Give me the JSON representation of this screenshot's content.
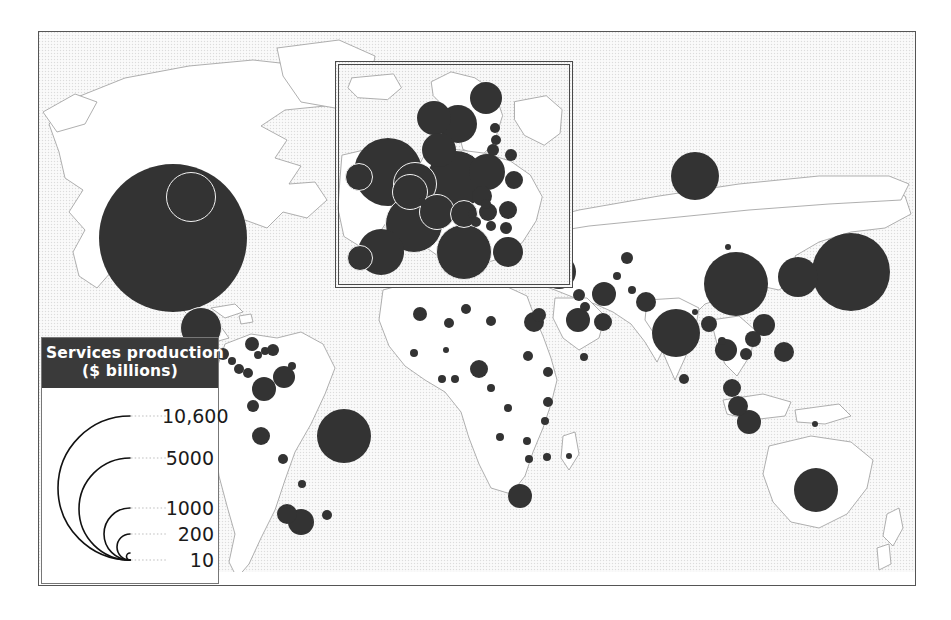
{
  "figure": {
    "type": "proportional-symbol-map",
    "theme": "Services production by country",
    "units": "$ billions"
  },
  "legend": {
    "title_line1": "Services production",
    "title_line2": "($ billions)",
    "scale_type": "nested semicircle area scale",
    "breaks": [
      {
        "label": "10,600",
        "value": 10600
      },
      {
        "label": "5000",
        "value": 5000
      },
      {
        "label": "1000",
        "value": 1000
      },
      {
        "label": "200",
        "value": 200
      },
      {
        "label": "10",
        "value": 10
      }
    ]
  },
  "inset": {
    "region": "Europe",
    "label": ""
  },
  "colors": {
    "symbol_fill": "#333333",
    "symbol_halo": "#f2f2f2",
    "land_fill": "#ffffff",
    "land_stroke": "#9a9a9a",
    "ocean_tint": "#fdfdfd",
    "frame_stroke": "#555555",
    "legend_header_bg": "#3a3a3a",
    "legend_header_text": "#ffffff"
  },
  "chart_data": {
    "type": "scatter",
    "title": "Services production ($ billions)",
    "xlabel": "longitude",
    "ylabel": "latitude",
    "value_key": "services_production_usd_billions",
    "size_encoding": "circle area proportional to value",
    "legend_breaks": [
      10600,
      5000,
      1000,
      200,
      10
    ],
    "points": [
      {
        "name": "United States",
        "value": 10600,
        "cx": 134,
        "cy": 206,
        "r": 74
      },
      {
        "name": "Canada",
        "value": 700,
        "cx": 152,
        "cy": 165,
        "r": 25,
        "ring": true
      },
      {
        "name": "Mexico",
        "value": 480,
        "cx": 162,
        "cy": 296,
        "r": 21,
        "ring": true
      },
      {
        "name": "Guatemala",
        "value": 18,
        "cx": 184,
        "cy": 322,
        "r": 6
      },
      {
        "name": "Honduras",
        "value": 9,
        "cx": 193,
        "cy": 329,
        "r": 4
      },
      {
        "name": "Cuba",
        "value": 30,
        "cx": 213,
        "cy": 312,
        "r": 7
      },
      {
        "name": "Haiti",
        "value": 7,
        "cx": 226,
        "cy": 319,
        "r": 4
      },
      {
        "name": "Dominican Republic",
        "value": 22,
        "cx": 234,
        "cy": 318,
        "r": 6
      },
      {
        "name": "Jamaica",
        "value": 8,
        "cx": 219,
        "cy": 323,
        "r": 4
      },
      {
        "name": "Costa Rica",
        "value": 17,
        "cx": 200,
        "cy": 337,
        "r": 5
      },
      {
        "name": "Panama",
        "value": 14,
        "cx": 209,
        "cy": 341,
        "r": 5
      },
      {
        "name": "Trinidad",
        "value": 9,
        "cx": 253,
        "cy": 334,
        "r": 4
      },
      {
        "name": "Venezuela",
        "value": 70,
        "cx": 245,
        "cy": 345,
        "r": 11
      },
      {
        "name": "Colombia",
        "value": 60,
        "cx": 225,
        "cy": 357,
        "r": 12
      },
      {
        "name": "Ecuador",
        "value": 20,
        "cx": 214,
        "cy": 374,
        "r": 6
      },
      {
        "name": "Peru",
        "value": 40,
        "cx": 222,
        "cy": 404,
        "r": 9
      },
      {
        "name": "Brazil",
        "value": 480,
        "cx": 305,
        "cy": 404,
        "r": 27
      },
      {
        "name": "Bolivia",
        "value": 10,
        "cx": 244,
        "cy": 427,
        "r": 5
      },
      {
        "name": "Paraguay",
        "value": 8,
        "cx": 263,
        "cy": 452,
        "r": 4
      },
      {
        "name": "Chile",
        "value": 55,
        "cx": 248,
        "cy": 482,
        "r": 10
      },
      {
        "name": "Argentina",
        "value": 140,
        "cx": 262,
        "cy": 490,
        "r": 13
      },
      {
        "name": "Uruguay",
        "value": 12,
        "cx": 288,
        "cy": 483,
        "r": 5
      },
      {
        "name": "Morocco",
        "value": 30,
        "cx": 381,
        "cy": 282,
        "r": 7
      },
      {
        "name": "Algeria",
        "value": 30,
        "cx": 410,
        "cy": 291,
        "r": 5
      },
      {
        "name": "Tunisia",
        "value": 16,
        "cx": 427,
        "cy": 277,
        "r": 5
      },
      {
        "name": "Libya",
        "value": 12,
        "cx": 452,
        "cy": 289,
        "r": 5
      },
      {
        "name": "Egypt",
        "value": 60,
        "cx": 495,
        "cy": 290,
        "r": 10
      },
      {
        "name": "Senegal",
        "value": 7,
        "cx": 375,
        "cy": 321,
        "r": 4
      },
      {
        "name": "Mali",
        "value": 5,
        "cx": 407,
        "cy": 318,
        "r": 3
      },
      {
        "name": "Ghana",
        "value": 8,
        "cx": 416,
        "cy": 347,
        "r": 4
      },
      {
        "name": "Nigeria",
        "value": 38,
        "cx": 440,
        "cy": 337,
        "r": 9
      },
      {
        "name": "Cote d'Ivoire",
        "value": 9,
        "cx": 403,
        "cy": 347,
        "r": 4
      },
      {
        "name": "Cameroon",
        "value": 9,
        "cx": 452,
        "cy": 356,
        "r": 4
      },
      {
        "name": "Sudan",
        "value": 14,
        "cx": 489,
        "cy": 324,
        "r": 5
      },
      {
        "name": "Ethiopia",
        "value": 10,
        "cx": 509,
        "cy": 340,
        "r": 5
      },
      {
        "name": "Kenya",
        "value": 14,
        "cx": 509,
        "cy": 370,
        "r": 5
      },
      {
        "name": "Tanzania",
        "value": 10,
        "cx": 506,
        "cy": 389,
        "r": 4
      },
      {
        "name": "DR Congo",
        "value": 7,
        "cx": 469,
        "cy": 376,
        "r": 4
      },
      {
        "name": "Angola",
        "value": 11,
        "cx": 461,
        "cy": 405,
        "r": 4
      },
      {
        "name": "Zambia",
        "value": 6,
        "cx": 488,
        "cy": 409,
        "r": 4
      },
      {
        "name": "Zimbabwe",
        "value": 7,
        "cx": 490,
        "cy": 427,
        "r": 4
      },
      {
        "name": "Mozambique",
        "value": 6,
        "cx": 508,
        "cy": 425,
        "r": 4
      },
      {
        "name": "Madagascar",
        "value": 5,
        "cx": 530,
        "cy": 424,
        "r": 3
      },
      {
        "name": "South Africa",
        "value": 110,
        "cx": 481,
        "cy": 464,
        "r": 12
      },
      {
        "name": "Israel",
        "value": 85,
        "cx": 500,
        "cy": 283,
        "r": 7
      },
      {
        "name": "Turkey",
        "value": 170,
        "cx": 520,
        "cy": 240,
        "r": 17
      },
      {
        "name": "Greece",
        "value": 120,
        "cx": 498,
        "cy": 247,
        "r": 6
      },
      {
        "name": "Saudi Arabia",
        "value": 110,
        "cx": 539,
        "cy": 288,
        "r": 12
      },
      {
        "name": "United Arab Emirates",
        "value": 50,
        "cx": 564,
        "cy": 290,
        "r": 9
      },
      {
        "name": "Iran",
        "value": 90,
        "cx": 565,
        "cy": 262,
        "r": 12
      },
      {
        "name": "Iraq",
        "value": 20,
        "cx": 540,
        "cy": 263,
        "r": 6
      },
      {
        "name": "Kuwait",
        "value": 18,
        "cx": 546,
        "cy": 275,
        "r": 5
      },
      {
        "name": "Yemen",
        "value": 7,
        "cx": 545,
        "cy": 325,
        "r": 4
      },
      {
        "name": "Kazakhstan",
        "value": 30,
        "cx": 588,
        "cy": 226,
        "r": 6
      },
      {
        "name": "Uzbekistan",
        "value": 10,
        "cx": 578,
        "cy": 244,
        "r": 4
      },
      {
        "name": "Russia",
        "value": 420,
        "cx": 656,
        "cy": 144,
        "r": 24
      },
      {
        "name": "Pakistan",
        "value": 55,
        "cx": 607,
        "cy": 270,
        "r": 10
      },
      {
        "name": "Afghanistan",
        "value": 8,
        "cx": 593,
        "cy": 258,
        "r": 4
      },
      {
        "name": "India",
        "value": 400,
        "cx": 637,
        "cy": 301,
        "r": 24
      },
      {
        "name": "Sri Lanka",
        "value": 12,
        "cx": 645,
        "cy": 347,
        "r": 5
      },
      {
        "name": "Bangladesh",
        "value": 35,
        "cx": 670,
        "cy": 292,
        "r": 8
      },
      {
        "name": "Nepal",
        "value": 5,
        "cx": 656,
        "cy": 280,
        "r": 3
      },
      {
        "name": "China",
        "value": 1100,
        "cx": 697,
        "cy": 252,
        "r": 32
      },
      {
        "name": "Mongolia",
        "value": 3,
        "cx": 689,
        "cy": 215,
        "r": 3
      },
      {
        "name": "South Korea",
        "value": 370,
        "cx": 759,
        "cy": 245,
        "r": 20
      },
      {
        "name": "Japan",
        "value": 3200,
        "cx": 812,
        "cy": 240,
        "r": 39
      },
      {
        "name": "Taiwan",
        "value": 190,
        "cx": 725,
        "cy": 293,
        "r": 11
      },
      {
        "name": "Hong Kong",
        "value": 120,
        "cx": 714,
        "cy": 307,
        "r": 8
      },
      {
        "name": "Myanmar",
        "value": 7,
        "cx": 683,
        "cy": 309,
        "r": 4
      },
      {
        "name": "Thailand",
        "value": 80,
        "cx": 687,
        "cy": 318,
        "r": 11
      },
      {
        "name": "Vietnam",
        "value": 25,
        "cx": 707,
        "cy": 322,
        "r": 6
      },
      {
        "name": "Philippines",
        "value": 45,
        "cx": 745,
        "cy": 320,
        "r": 10
      },
      {
        "name": "Malaysia",
        "value": 50,
        "cx": 693,
        "cy": 356,
        "r": 9
      },
      {
        "name": "Singapore",
        "value": 60,
        "cx": 699,
        "cy": 374,
        "r": 10
      },
      {
        "name": "Indonesia",
        "value": 110,
        "cx": 710,
        "cy": 390,
        "r": 12
      },
      {
        "name": "Papua New Guinea",
        "value": 4,
        "cx": 776,
        "cy": 392,
        "r": 3
      },
      {
        "name": "Australia",
        "value": 300,
        "cx": 777,
        "cy": 458,
        "r": 22
      },
      {
        "name": "New Zealand",
        "value": 45,
        "cx": 848,
        "cy": 512,
        "r": 0
      }
    ],
    "inset_points": [
      {
        "name": "Iceland",
        "value": 7,
        "cx": 31,
        "cy": 24,
        "r": 0
      },
      {
        "name": "United Kingdom",
        "value": 1300,
        "cx": 52,
        "cy": 110,
        "r": 34
      },
      {
        "name": "Ireland",
        "value": 95,
        "cx": 23,
        "cy": 115,
        "r": 14,
        "ring": true
      },
      {
        "name": "Norway",
        "value": 170,
        "cx": 98,
        "cy": 56,
        "r": 17
      },
      {
        "name": "Sweden",
        "value": 200,
        "cx": 122,
        "cy": 62,
        "r": 19
      },
      {
        "name": "Finland",
        "value": 110,
        "cx": 150,
        "cy": 36,
        "r": 16
      },
      {
        "name": "Denmark",
        "value": 140,
        "cx": 103,
        "cy": 88,
        "r": 17
      },
      {
        "name": "Netherlands",
        "value": 330,
        "cx": 79,
        "cy": 122,
        "r": 22,
        "ring": true
      },
      {
        "name": "Belgium",
        "value": 200,
        "cx": 74,
        "cy": 130,
        "r": 18,
        "ring": true
      },
      {
        "name": "Germany",
        "value": 1500,
        "cx": 120,
        "cy": 118,
        "r": 30,
        "ring": true
      },
      {
        "name": "France",
        "value": 1200,
        "cx": 78,
        "cy": 162,
        "r": 29,
        "ring": true
      },
      {
        "name": "Spain",
        "value": 500,
        "cx": 45,
        "cy": 190,
        "r": 23
      },
      {
        "name": "Portugal",
        "value": 100,
        "cx": 24,
        "cy": 196,
        "r": 13,
        "ring": true
      },
      {
        "name": "Italy",
        "value": 900,
        "cx": 128,
        "cy": 190,
        "r": 28,
        "ring": true
      },
      {
        "name": "Switzerland",
        "value": 220,
        "cx": 101,
        "cy": 150,
        "r": 18,
        "ring": true
      },
      {
        "name": "Austria",
        "value": 160,
        "cx": 128,
        "cy": 152,
        "r": 14,
        "ring": true
      },
      {
        "name": "Poland",
        "value": 150,
        "cx": 151,
        "cy": 110,
        "r": 18
      },
      {
        "name": "Czech Republic",
        "value": 55,
        "cx": 146,
        "cy": 134,
        "r": 10
      },
      {
        "name": "Hungary",
        "value": 45,
        "cx": 152,
        "cy": 150,
        "r": 9
      },
      {
        "name": "Estonia",
        "value": 8,
        "cx": 159,
        "cy": 66,
        "r": 5
      },
      {
        "name": "Latvia",
        "value": 8,
        "cx": 160,
        "cy": 78,
        "r": 5
      },
      {
        "name": "Lithuania",
        "value": 12,
        "cx": 157,
        "cy": 88,
        "r": 6
      },
      {
        "name": "Belarus",
        "value": 15,
        "cx": 175,
        "cy": 93,
        "r": 6
      },
      {
        "name": "Ukraine",
        "value": 45,
        "cx": 178,
        "cy": 118,
        "r": 9
      },
      {
        "name": "Romania",
        "value": 40,
        "cx": 172,
        "cy": 148,
        "r": 9
      },
      {
        "name": "Slovakia",
        "value": 22,
        "cx": 150,
        "cy": 142,
        "r": 5
      },
      {
        "name": "Croatia",
        "value": 20,
        "cx": 140,
        "cy": 160,
        "r": 5
      },
      {
        "name": "Slovenia",
        "value": 17,
        "cx": 136,
        "cy": 152,
        "r": 4
      },
      {
        "name": "Serbia",
        "value": 15,
        "cx": 155,
        "cy": 164,
        "r": 5
      },
      {
        "name": "Bulgaria",
        "value": 18,
        "cx": 170,
        "cy": 166,
        "r": 6
      },
      {
        "name": "Greece",
        "value": 120,
        "cx": 172,
        "cy": 190,
        "r": 15
      },
      {
        "name": "Luxembourg",
        "value": 22,
        "cx": 86,
        "cy": 140,
        "r": 4
      }
    ]
  }
}
